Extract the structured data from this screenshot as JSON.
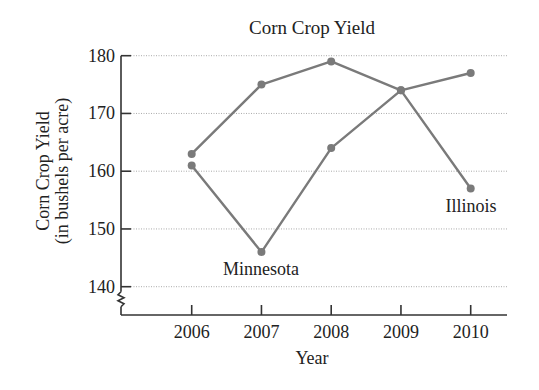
{
  "chart_data": {
    "type": "line",
    "title": "Corn Crop Yield",
    "xlabel": "Year",
    "ylabel": "Corn Crop Yield",
    "ylabel_sub": "(in bushels per acre)",
    "categories": [
      "2006",
      "2007",
      "2008",
      "2009",
      "2010"
    ],
    "yticks": [
      "140",
      "150",
      "160",
      "170",
      "180"
    ],
    "ylim": [
      140,
      180
    ],
    "y_axis_break": true,
    "grid": true,
    "legend": "inline labels",
    "series": [
      {
        "name": "Minnesota",
        "values": [
          161,
          146,
          164,
          174,
          177
        ],
        "color": "#7a7a7a"
      },
      {
        "name": "Illinois",
        "values": [
          163,
          175,
          179,
          174,
          157
        ],
        "color": "#7a7a7a"
      }
    ],
    "annotations": [
      {
        "text": "Minnesota",
        "near": "2007"
      },
      {
        "text": "Illinois",
        "near": "2010"
      }
    ]
  }
}
